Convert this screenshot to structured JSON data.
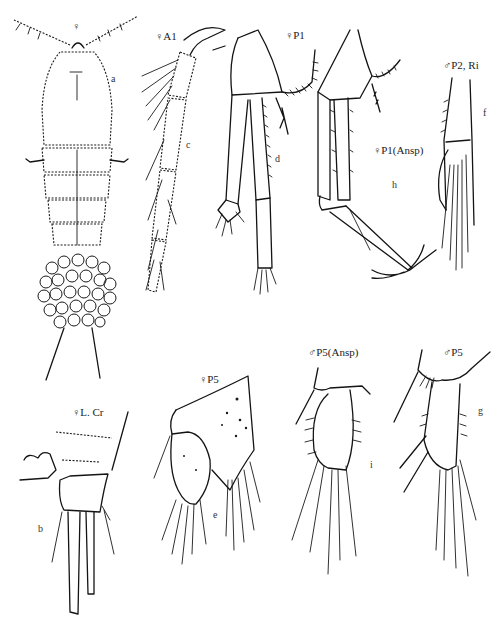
{
  "plate": {
    "description": "Copepod morphology plate (line drawings)",
    "background": "#ffffff",
    "ink_color": "#141414"
  },
  "figures": [
    {
      "id": "a",
      "title": "♀",
      "letter": "a",
      "subject": "female habitus, dorsal view"
    },
    {
      "id": "c",
      "title": "♀A1",
      "letter": "c",
      "subject": "female antennule"
    },
    {
      "id": "d",
      "title": "♀P1",
      "letter": "d",
      "subject": "female leg 1"
    },
    {
      "id": "h",
      "title": "♀P1(Ansp)",
      "letter": "h",
      "subject": "female leg 1 (Ansp)"
    },
    {
      "id": "f",
      "title": "♂P2, Ri",
      "letter": "f",
      "subject": "male leg 2 endopod"
    },
    {
      "id": "b",
      "title": "♀L. Cr",
      "letter": "b",
      "subject": "female caudal ramus"
    },
    {
      "id": "e",
      "title": "♀P5",
      "letter": "e",
      "subject": "female leg 5"
    },
    {
      "id": "i",
      "title": "♂P5(Ansp)",
      "letter": "i",
      "subject": "male leg 5 (Ansp)"
    },
    {
      "id": "g",
      "title": "♂P5",
      "letter": "g",
      "subject": "male leg 5"
    }
  ]
}
